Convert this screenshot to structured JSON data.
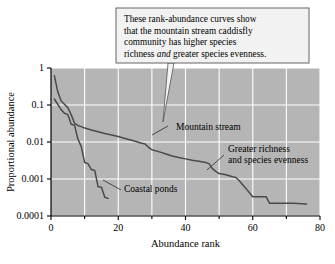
{
  "callout": {
    "name": "callout-box",
    "lines": [
      {
        "pre": "These rank-abundance curves show",
        "em": "",
        "post": ""
      },
      {
        "pre": "that the mountain stream caddisfly",
        "em": "",
        "post": ""
      },
      {
        "pre": "community has higher species",
        "em": "",
        "post": ""
      },
      {
        "pre": "richness ",
        "em": "and",
        "post": " greater species evenness."
      }
    ],
    "full_text": "These rank-abundance curves show that the mountain stream caddisfly community has higher species richness and greater species evenness.",
    "bg_color": "#f2f2f2",
    "border_color": "#555555"
  },
  "annotations": [
    {
      "name": "annotation-mountain-stream",
      "lines": [
        "Mountain stream"
      ],
      "x": 176,
      "y": 130
    },
    {
      "name": "annotation-greater-richness",
      "lines": [
        "Greater richness",
        "and species evenness"
      ],
      "x": 228,
      "y": 152
    },
    {
      "name": "annotation-coastal-ponds",
      "lines": [
        "Coastal ponds"
      ],
      "x": 124,
      "y": 192
    }
  ],
  "chart_data": {
    "type": "line",
    "title": "",
    "xlabel": "Abundance rank",
    "ylabel": "Proportional abundance",
    "xlim": [
      0,
      80
    ],
    "ylim": [
      0.0001,
      1
    ],
    "yscale": "log",
    "grid": true,
    "grid_color": "#ffffff",
    "plot_bg": "#b5b5b5",
    "legend_position": "inline-annotations",
    "xticks": [
      0,
      20,
      40,
      60,
      80
    ],
    "xticks_minor": [
      10,
      30,
      50,
      70
    ],
    "yticks": [
      1,
      0.1,
      0.01,
      0.001,
      0.0001
    ],
    "ytick_labels": [
      "1",
      "0.1",
      "0.01",
      "0.001",
      "0.0001"
    ],
    "series": [
      {
        "name": "Mountain stream",
        "color": "#4a4a4a",
        "x": [
          1,
          2,
          3,
          4,
          5,
          6,
          7,
          8,
          9,
          10,
          12,
          14,
          16,
          18,
          20,
          22,
          24,
          26,
          27,
          28,
          29,
          30,
          32,
          34,
          36,
          38,
          40,
          42,
          44,
          46,
          47,
          48,
          49,
          50,
          52,
          54,
          55,
          56,
          57,
          58,
          60,
          62,
          64,
          65,
          68,
          72,
          76
        ],
        "y": [
          0.62,
          0.23,
          0.13,
          0.105,
          0.085,
          0.055,
          0.032,
          0.028,
          0.026,
          0.024,
          0.021,
          0.019,
          0.017,
          0.0155,
          0.014,
          0.0125,
          0.0112,
          0.0098,
          0.0092,
          0.0088,
          0.0072,
          0.0062,
          0.0055,
          0.0048,
          0.0042,
          0.0038,
          0.0035,
          0.0032,
          0.003,
          0.0028,
          0.0026,
          0.0019,
          0.0016,
          0.0014,
          0.0013,
          0.00115,
          0.0011,
          0.0009,
          0.0007,
          0.00055,
          0.00033,
          0.00033,
          0.00033,
          0.00022,
          0.00022,
          0.00022,
          0.00021
        ]
      },
      {
        "name": "Coastal ponds",
        "color": "#4a4a4a",
        "x": [
          1,
          2,
          3,
          4,
          5,
          6,
          7,
          8,
          9,
          10,
          11,
          12,
          13,
          14,
          15,
          16,
          17
        ],
        "y": [
          0.145,
          0.105,
          0.075,
          0.06,
          0.055,
          0.03,
          0.0285,
          0.012,
          0.0075,
          0.0028,
          0.0026,
          0.0018,
          0.0017,
          0.00062,
          0.0006,
          0.00032,
          0.0003
        ]
      }
    ]
  }
}
